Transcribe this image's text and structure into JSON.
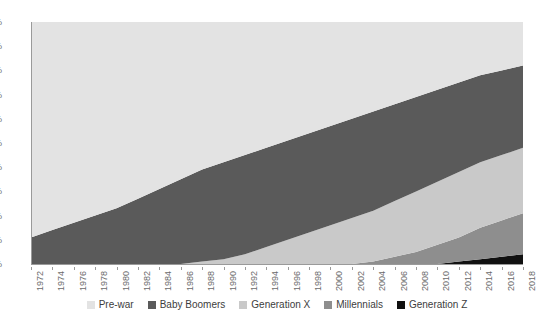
{
  "chart_data": {
    "type": "area",
    "title": "",
    "subtitle": "",
    "xlabel": "",
    "ylabel": "",
    "stacked": true,
    "normalized_percent": true,
    "grid": false,
    "legend_position": "bottom",
    "xlim": [
      1972,
      2018
    ],
    "ylim": [
      0,
      100
    ],
    "x": [
      1972,
      1974,
      1976,
      1978,
      1980,
      1982,
      1984,
      1986,
      1988,
      1990,
      1992,
      1994,
      1996,
      1998,
      2000,
      2002,
      2004,
      2006,
      2008,
      2010,
      2012,
      2014,
      2016,
      2018
    ],
    "categories": [
      "1972",
      "1974",
      "1976",
      "1978",
      "1980",
      "1982",
      "1984",
      "1986",
      "1988",
      "1990",
      "1992",
      "1994",
      "1996",
      "1998",
      "2000",
      "2002",
      "2004",
      "2006",
      "2008",
      "2010",
      "2012",
      "2014",
      "2016",
      "2018"
    ],
    "xtick_labels": [
      "1972",
      "1974",
      "1976",
      "1978",
      "1980",
      "1982",
      "1984",
      "1986",
      "1988",
      "1990",
      "1992",
      "1994",
      "1996",
      "1998",
      "2000",
      "2002",
      "2004",
      "2006",
      "2008",
      "2010",
      "2012",
      "2014",
      "2016",
      "2018"
    ],
    "ytick_labels": [
      "0%",
      "10%",
      "20%",
      "30%",
      "40%",
      "50%",
      "60%",
      "70%",
      "80%",
      "90%",
      "100%"
    ],
    "ytick_values": [
      0,
      10,
      20,
      30,
      40,
      50,
      60,
      70,
      80,
      90,
      100
    ],
    "series": [
      {
        "name": "Pre-war",
        "color": "#e3e3e3",
        "stack_order": 5,
        "values": [
          89,
          86,
          83,
          80,
          77,
          73,
          69,
          65,
          61,
          58,
          55,
          52,
          49,
          46,
          43,
          40,
          37,
          34,
          31,
          28,
          25,
          22,
          20,
          18
        ]
      },
      {
        "name": "Baby Boomers",
        "color": "#5a5a5a",
        "stack_order": 4,
        "values": [
          11,
          14,
          17,
          20,
          23,
          27,
          31,
          35,
          38,
          40,
          41,
          41,
          41,
          41,
          41,
          41,
          41,
          40,
          39,
          38,
          37,
          36,
          35,
          34
        ]
      },
      {
        "name": "Generation X",
        "color": "#c9c9c9",
        "stack_order": 3,
        "values": [
          0,
          0,
          0,
          0,
          0,
          0,
          0,
          0,
          1,
          2,
          4,
          7,
          10,
          13,
          16,
          19,
          21,
          23,
          25,
          26,
          27,
          27,
          27,
          27
        ]
      },
      {
        "name": "Millennials",
        "color": "#8e8e8e",
        "stack_order": 2,
        "values": [
          0,
          0,
          0,
          0,
          0,
          0,
          0,
          0,
          0,
          0,
          0,
          0,
          0,
          0,
          0,
          0,
          1,
          3,
          5,
          8,
          10,
          13,
          15,
          17
        ]
      },
      {
        "name": "Generation Z",
        "color": "#111111",
        "stack_order": 1,
        "values": [
          0,
          0,
          0,
          0,
          0,
          0,
          0,
          0,
          0,
          0,
          0,
          0,
          0,
          0,
          0,
          0,
          0,
          0,
          0,
          0,
          1,
          2,
          3,
          4
        ]
      }
    ]
  },
  "legend": {
    "items": [
      {
        "label": "Pre-war",
        "color": "#e3e3e3"
      },
      {
        "label": "Baby Boomers",
        "color": "#5a5a5a"
      },
      {
        "label": "Generation X",
        "color": "#c9c9c9"
      },
      {
        "label": "Millennials",
        "color": "#8e8e8e"
      },
      {
        "label": "Generation Z",
        "color": "#111111"
      }
    ]
  },
  "axes": {
    "y_axis_color": "#9a9a9a",
    "x_axis_color": "#9a9a9a",
    "tick_text_color": "#6b6b6b"
  }
}
